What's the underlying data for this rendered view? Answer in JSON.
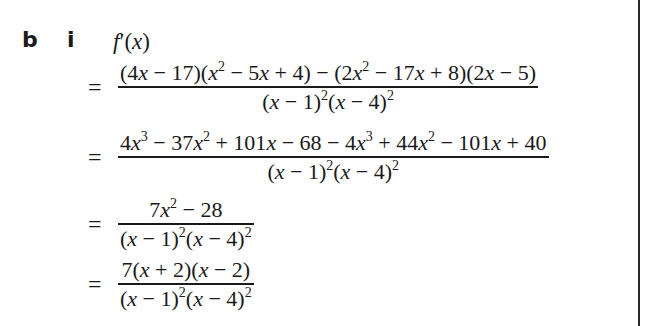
{
  "labels": {
    "part": "b",
    "subpart": "i"
  },
  "header": {
    "expression": "f′(x)"
  },
  "steps": [
    {
      "equals": "=",
      "numerator": "(4x − 17)(x² − 5x + 4) − (2x² − 17x + 8)(2x − 5)",
      "denominator": "(x − 1)²(x − 4)²"
    },
    {
      "equals": "=",
      "numerator": "4x³ − 37x² + 101x − 68 − 4x³ + 44x² − 101x + 40",
      "denominator": "(x − 1)²(x − 4)²"
    },
    {
      "equals": "=",
      "numerator": "7x² − 28",
      "denominator": "(x − 1)²(x − 4)²"
    },
    {
      "equals": "=",
      "numerator": "7(x + 2)(x − 2)",
      "denominator": "(x − 1)²(x − 4)²"
    }
  ],
  "colors": {
    "text": "#1a1a1a",
    "background": "#ffffff",
    "border": "#2a2a2a"
  }
}
